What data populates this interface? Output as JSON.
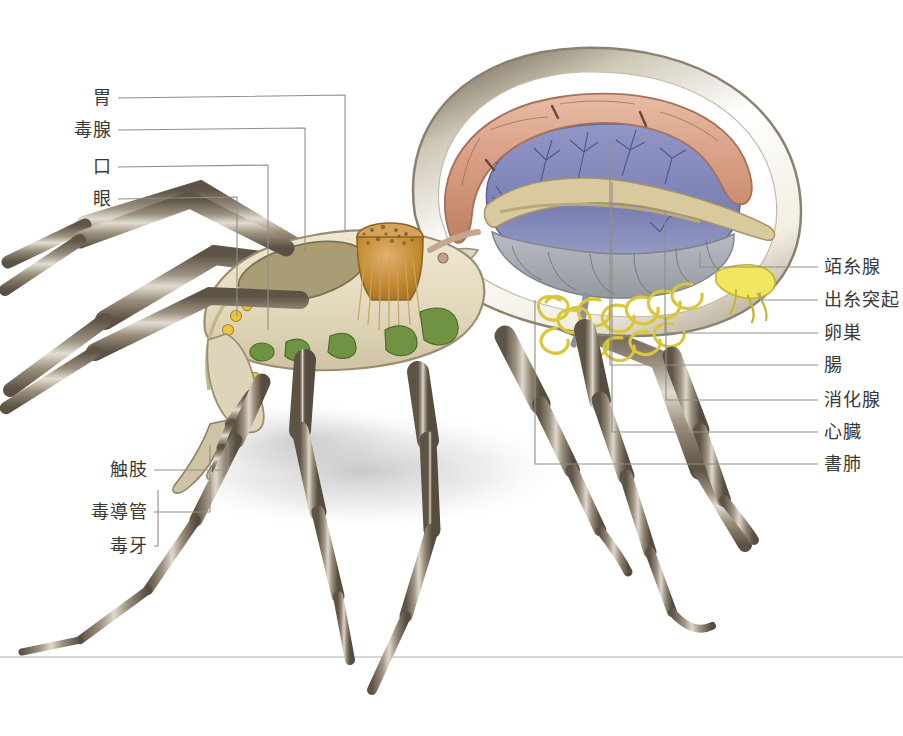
{
  "figure": {
    "background_color": "#ffffff",
    "leader_line_color": "#8f8f8a",
    "label_text_color": "#3a3a38",
    "ground_line_y": 657
  },
  "labels_left": [
    {
      "id": "stomach",
      "text": "胃",
      "text_x": 112,
      "text_y": 98,
      "line": "M118,98 L345,95 L345,232",
      "target": "sucking stomach"
    },
    {
      "id": "venom-gland",
      "text": "毒腺",
      "text_x": 112,
      "text_y": 130,
      "line": "M118,130 L305,128 L305,252",
      "target": "venom gland"
    },
    {
      "id": "mouth",
      "text": "口",
      "text_x": 112,
      "text_y": 167,
      "line": "M118,167 L268,165 L268,330",
      "target": "mouth"
    },
    {
      "id": "eye",
      "text": "眼",
      "text_x": 112,
      "text_y": 199,
      "line": "M118,199 L237,197 L237,316",
      "target": "eyes"
    },
    {
      "id": "pedipalp",
      "text": "触肢",
      "text_x": 148,
      "text_y": 470,
      "line": "M154,470 L228,470 L228,443",
      "target": "pedipalp"
    },
    {
      "id": "venom-duct",
      "text": "毒導管",
      "text_x": 148,
      "text_y": 512,
      "line": "M154,512 L210,512 L210,445",
      "target": "venom duct"
    },
    {
      "id": "fang",
      "text": "毒牙",
      "text_x": 148,
      "text_y": 546,
      "line": "M154,546 L158,546 L158,490",
      "target": "fang"
    }
  ],
  "labels_right": [
    {
      "id": "silk-gland",
      "text": "竡糸腺",
      "text_x": 824,
      "text_y": 267,
      "line": "M818,267 L700,267 L700,252",
      "target": "silk gland"
    },
    {
      "id": "spinneret",
      "text": "出糸突起",
      "text_x": 824,
      "text_y": 300,
      "line": "M818,300 L760,300 L760,292",
      "target": "spinneret"
    },
    {
      "id": "ovary",
      "text": "卵巣",
      "text_x": 824,
      "text_y": 333,
      "line": "M818,333 L665,333 L665,212",
      "target": "ovary"
    },
    {
      "id": "intestine",
      "text": "腸",
      "text_x": 824,
      "text_y": 365,
      "line": "M818,365 L610,365 L610,140",
      "target": "intestine"
    },
    {
      "id": "digestive-gland",
      "text": "消化腺",
      "text_x": 824,
      "text_y": 400,
      "line": "M818,400 L666,400 L666,318",
      "target": "digestive gland"
    },
    {
      "id": "heart",
      "text": "心臓",
      "text_x": 824,
      "text_y": 432,
      "line": "M818,432 L612,432 L612,182",
      "target": "heart"
    },
    {
      "id": "book-lung",
      "text": "書肺",
      "text_x": 824,
      "text_y": 464,
      "line": "M818,464 L535,464 L535,300",
      "target": "book lung"
    }
  ],
  "anatomy_colors": {
    "leg_dark": "#6e6354",
    "leg_mid": "#9a8f7c",
    "leg_light": "#d8d2c4",
    "abdomen_wall": "#ded7c8",
    "abdomen_inner": "#ffffff",
    "heart_tube": "#d9a189",
    "digestive_gland": "#8b8ec0",
    "book_lung": "#5f6ba8",
    "silk_gland": "#e8d84a",
    "spinneret": "#f0e36a",
    "ovary": "#d8c9a0",
    "intestine": "#c9b98e",
    "stomach": "#c98f3e",
    "venom_gland": "#a39a73",
    "cephalothorax": "#e5dcc0",
    "muscle_green": "#6f9342",
    "eye_spot": "#e8c547",
    "ground_shadow": "#bdbdbd"
  }
}
